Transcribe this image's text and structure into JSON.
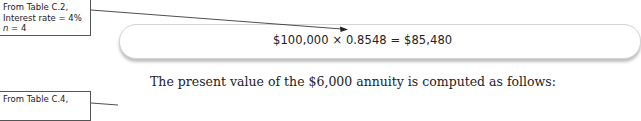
{
  "callouts": [
    {
      "line1": "From Table C.2,",
      "line2": "Interest rate = 4%",
      "line3_var": "n",
      "line3_rest": " = 4"
    },
    {
      "line1": "From Table C.4,"
    }
  ],
  "formula": {
    "text": "$100,000 × 0.8548 = $85,480"
  },
  "body_text": {
    "sentence": "The present value of the $6,000 annuity is computed as follows:"
  }
}
